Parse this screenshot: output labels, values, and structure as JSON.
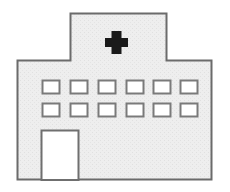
{
  "image": {
    "type": "pictogram",
    "subject": "hospital-building",
    "alt_text": "Hospital building icon with medical cross on tower, two rows of six windows, and a door",
    "width": 230,
    "height": 192,
    "background_color": "#ffffff"
  },
  "palette": {
    "wall_fill": "#ededed",
    "wall_fill_light": "#f2f2f2",
    "outline": "#6b6b6b",
    "outline_dark": "#555555",
    "cross_color": "#1a1a1a",
    "window_fill": "#ffffff",
    "window_outline": "#7a7a7a",
    "door_fill": "#ffffff",
    "door_outline": "#6f6f6f"
  },
  "shapes": {
    "tower": {
      "label": "roof-tower",
      "x": 70,
      "y": 13,
      "width": 97,
      "height": 48
    },
    "main_body": {
      "label": "main-building-body",
      "x": 17,
      "y": 60,
      "width": 195,
      "height": 120
    },
    "cross": {
      "label": "medical-cross",
      "center_x": 116,
      "center_y": 42,
      "arm_length": 22,
      "arm_thickness": 8
    },
    "door": {
      "label": "entrance-door",
      "x": 41,
      "y": 130,
      "width": 37,
      "height": 50
    }
  },
  "windows": {
    "label": "window-grid",
    "columns": 6,
    "rows": 2,
    "window_width": 17,
    "window_height": 13,
    "column_x": [
      42,
      73,
      104,
      135,
      166,
      180
    ],
    "row_y": [
      80,
      103
    ],
    "items": [
      {
        "row": 1,
        "col": 1,
        "x": 42,
        "y": 80
      },
      {
        "row": 1,
        "col": 2,
        "x": 73,
        "y": 80
      },
      {
        "row": 1,
        "col": 3,
        "x": 104,
        "y": 80
      },
      {
        "row": 1,
        "col": 4,
        "x": 135,
        "y": 80
      },
      {
        "row": 1,
        "col": 5,
        "x": 160,
        "y": 80
      },
      {
        "row": 1,
        "col": 6,
        "x": 180,
        "y": 80
      },
      {
        "row": 2,
        "col": 1,
        "x": 42,
        "y": 103
      },
      {
        "row": 2,
        "col": 2,
        "x": 73,
        "y": 103
      },
      {
        "row": 2,
        "col": 3,
        "x": 104,
        "y": 103
      },
      {
        "row": 2,
        "col": 4,
        "x": 135,
        "y": 103
      },
      {
        "row": 2,
        "col": 5,
        "x": 160,
        "y": 103
      },
      {
        "row": 2,
        "col": 6,
        "x": 180,
        "y": 103
      }
    ]
  }
}
